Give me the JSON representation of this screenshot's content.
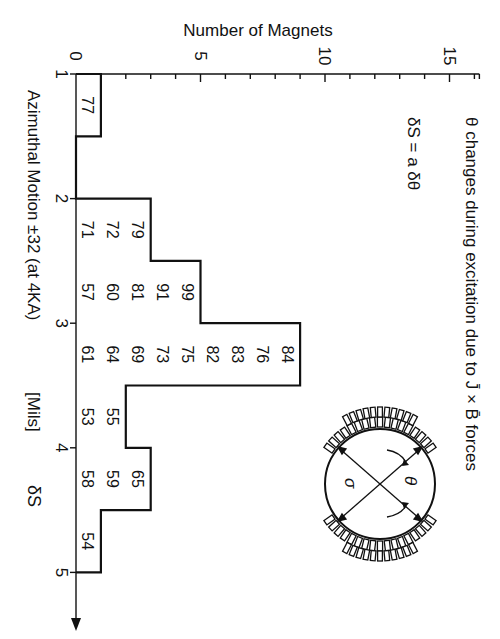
{
  "chart_data": {
    "type": "bar",
    "orientation": "histogram, rotated 90 degrees clockwise (bins run top-to-bottom, counts run left-to-right)",
    "title": "θ changes during excitation due to J̄ × B̄ forces",
    "annotation": "δS = a δθ",
    "xlabel": "Azimuthal Motion ±32 (at 4KA)  [Mils]   δS",
    "ylabel": "Number of Magnets",
    "x_axis_label_parts": {
      "main": "Azimuthal Motion ±32 (at 4KA)",
      "unit": "[Mils]",
      "symbol": "δS"
    },
    "xlim": [
      1,
      5
    ],
    "ylim": [
      0,
      16
    ],
    "x_ticks": [
      "1",
      "2",
      "3",
      "4",
      "5"
    ],
    "y_ticks": [
      "0",
      "5",
      "10",
      "15"
    ],
    "bin_width": 0.5,
    "categories": [
      "1.0-1.5",
      "1.5-2.0",
      "2.0-2.5",
      "2.5-3.0",
      "3.0-3.5",
      "3.5-4.0",
      "4.0-4.5",
      "4.5-5.0"
    ],
    "bin_starts": [
      1.0,
      1.5,
      2.0,
      2.5,
      3.0,
      3.5,
      4.0,
      4.5
    ],
    "values": [
      1,
      0,
      3,
      5,
      9,
      2,
      3,
      1
    ],
    "magnet_ids": [
      [
        "77"
      ],
      [],
      [
        "71",
        "72",
        "79"
      ],
      [
        "57",
        "60",
        "81",
        "91",
        "99"
      ],
      [
        "61",
        "64",
        "69",
        "73",
        "75",
        "82",
        "83",
        "76",
        "84"
      ],
      [
        "53",
        "55"
      ],
      [
        "58",
        "59",
        "65"
      ],
      [
        "54"
      ]
    ],
    "grid": false,
    "legend": null
  },
  "inset_diagram": {
    "description": "Cross-section of magnet with coil blocks above and below a circular aperture; crossed double arrows with curved rotation arrows",
    "labels": {
      "left_symbol": "σ",
      "right_symbol": "θ"
    }
  },
  "colors": {
    "ink": "#111111",
    "background": "#ffffff"
  }
}
